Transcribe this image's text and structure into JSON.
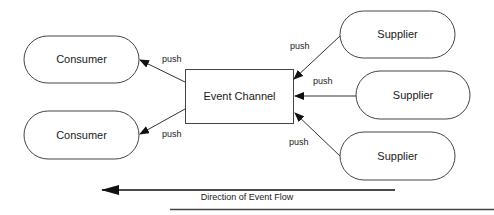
{
  "diagram": {
    "consumers": [
      {
        "label": "Consumer"
      },
      {
        "label": "Consumer"
      }
    ],
    "channel": {
      "label": "Event Channel"
    },
    "suppliers": [
      {
        "label": "Supplier"
      },
      {
        "label": "Supplier"
      },
      {
        "label": "Supplier"
      }
    ],
    "edge_labels": {
      "consumer_top": "push",
      "consumer_bottom": "push",
      "supplier_top": "push",
      "supplier_middle": "push",
      "supplier_bottom": "push"
    },
    "flow": {
      "label": "Direction of Event Flow"
    },
    "colors": {
      "stroke": "#333333",
      "text": "#1a1a1a",
      "background": "#ffffff"
    }
  }
}
